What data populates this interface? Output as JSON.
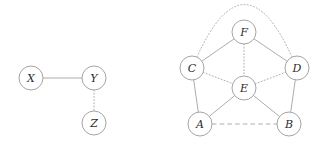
{
  "figure": {
    "title": "",
    "background_color": "#ffffff",
    "node_stroke_color": "#9a9a9a",
    "node_fill_color": "#ffffff",
    "edge_color": "#9e9e9e",
    "label_color": "#2b2b2b",
    "node_radius": 12
  },
  "graphs": [
    {
      "id": "left-graph",
      "name": "graph-xyz",
      "nodes": [
        {
          "id": "X",
          "label": "X",
          "cx": 31,
          "cy": 78,
          "r": 12
        },
        {
          "id": "Y",
          "label": "Y",
          "cx": 94,
          "cy": 78,
          "r": 12
        },
        {
          "id": "Z",
          "label": "Z",
          "cx": 94,
          "cy": 123,
          "r": 12
        }
      ],
      "edges": [
        {
          "from": "X",
          "to": "Y",
          "style": "solid"
        },
        {
          "from": "Y",
          "to": "Z",
          "style": "dotted"
        }
      ]
    },
    {
      "id": "right-graph",
      "name": "graph-abcdef",
      "nodes": [
        {
          "id": "F",
          "label": "F",
          "cx": 244,
          "cy": 32,
          "r": 12
        },
        {
          "id": "C",
          "label": "C",
          "cx": 192,
          "cy": 68,
          "r": 12
        },
        {
          "id": "D",
          "label": "D",
          "cx": 297,
          "cy": 68,
          "r": 12
        },
        {
          "id": "E",
          "label": "E",
          "cx": 244,
          "cy": 88,
          "r": 12
        },
        {
          "id": "A",
          "label": "A",
          "cx": 200,
          "cy": 124,
          "r": 12
        },
        {
          "id": "B",
          "label": "B",
          "cx": 289,
          "cy": 124,
          "r": 12
        }
      ],
      "edges": [
        {
          "from": "C",
          "to": "D",
          "style": "dotted",
          "shape": "arc",
          "arc_peak_y": 10
        },
        {
          "from": "C",
          "to": "F",
          "style": "solid"
        },
        {
          "from": "F",
          "to": "D",
          "style": "solid"
        },
        {
          "from": "F",
          "to": "E",
          "style": "dotted"
        },
        {
          "from": "C",
          "to": "E",
          "style": "dotted"
        },
        {
          "from": "E",
          "to": "D",
          "style": "dotted"
        },
        {
          "from": "C",
          "to": "A",
          "style": "solid"
        },
        {
          "from": "D",
          "to": "B",
          "style": "solid"
        },
        {
          "from": "A",
          "to": "E",
          "style": "solid"
        },
        {
          "from": "E",
          "to": "B",
          "style": "solid"
        },
        {
          "from": "A",
          "to": "B",
          "style": "dashed"
        }
      ]
    }
  ]
}
